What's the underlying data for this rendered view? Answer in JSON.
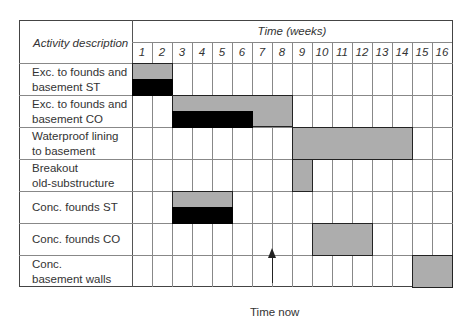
{
  "header": {
    "activity_col_label": "Activity description",
    "time_label": "Time (weeks)",
    "weeks": [
      "1",
      "2",
      "3",
      "4",
      "5",
      "6",
      "7",
      "8",
      "9",
      "10",
      "11",
      "12",
      "13",
      "14",
      "15",
      "16"
    ]
  },
  "activities": [
    {
      "label": "Exc. to founds and\nbasement ST",
      "planned": [
        1,
        2
      ],
      "actual": [
        1,
        2
      ]
    },
    {
      "label": "Exc. to founds and\nbasement CO",
      "planned": [
        3,
        8
      ],
      "actual": [
        3,
        6
      ]
    },
    {
      "label": "Waterproof lining\nto basement",
      "planned": [
        9,
        14
      ],
      "actual": null
    },
    {
      "label": "Breakout\nold-substructure",
      "planned": [
        9,
        9
      ],
      "actual": null
    },
    {
      "label": "Conc. founds ST",
      "planned": [
        3,
        5
      ],
      "actual": [
        3,
        5
      ]
    },
    {
      "label": "Conc. founds CO",
      "planned": [
        10,
        12
      ],
      "actual": null
    },
    {
      "label": "Conc.\nbasement walls",
      "planned": [
        15,
        16
      ],
      "actual": null
    }
  ],
  "time_now": {
    "label": "Time now",
    "after_week": 7
  },
  "colors": {
    "planned": "#adadad",
    "actual": "#000000",
    "grid": "#888888",
    "border": "#444444"
  },
  "chart_data": {
    "type": "gantt",
    "title": "",
    "xlabel": "Time (weeks)",
    "ylabel": "Activity description",
    "x_ticks": [
      1,
      2,
      3,
      4,
      5,
      6,
      7,
      8,
      9,
      10,
      11,
      12,
      13,
      14,
      15,
      16
    ],
    "categories": [
      "Exc. to founds and basement ST",
      "Exc. to founds and basement CO",
      "Waterproof lining to basement",
      "Breakout old-substructure",
      "Conc. founds ST",
      "Conc. founds CO",
      "Conc. basement walls"
    ],
    "series": [
      {
        "name": "Planned (grey)",
        "values": [
          [
            1,
            2
          ],
          [
            3,
            8
          ],
          [
            9,
            14
          ],
          [
            9,
            9
          ],
          [
            3,
            5
          ],
          [
            10,
            12
          ],
          [
            15,
            16
          ]
        ]
      },
      {
        "name": "Progress (black)",
        "values": [
          [
            1,
            2
          ],
          [
            3,
            6
          ],
          null,
          null,
          [
            3,
            5
          ],
          null,
          null
        ]
      }
    ],
    "annotations": [
      {
        "text": "Time now",
        "x": 7.5,
        "type": "arrow"
      }
    ],
    "grid": true
  }
}
